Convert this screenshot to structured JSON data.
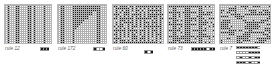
{
  "figure": {
    "type": "cellular-automaton-panels",
    "background": "#ffffff",
    "cell_on_color": "#1a1a1a",
    "cell_off_color": "#ffffff",
    "grid_line_color": "#b0b0b0",
    "caption_color": "#5a5a5a",
    "panel_count": 5
  },
  "panels": [
    {
      "id": "panel-1",
      "caption": "rule 12",
      "rule_number": 12,
      "x": 4,
      "y": 4,
      "width": 48,
      "height": 40,
      "cols": 24,
      "rows": 20,
      "pattern": "vertical-stripes",
      "seed": 12,
      "legend_x": 40,
      "legend_y": 47,
      "legend_cells": 3
    },
    {
      "id": "panel-2",
      "caption": "rule 172",
      "rule_number": 172,
      "x": 57,
      "y": 4,
      "width": 50,
      "height": 40,
      "cols": 25,
      "rows": 20,
      "pattern": "triangle-growth",
      "seed": 172,
      "legend_x": 93,
      "legend_y": 47,
      "legend_cells": 4
    },
    {
      "id": "panel-3",
      "caption": "rule 60",
      "rule_number": 60,
      "x": 112,
      "y": 4,
      "width": 52,
      "height": 40,
      "cols": 26,
      "rows": 20,
      "pattern": "nested-checker",
      "seed": 60,
      "legend_x": 144,
      "legend_y": 50,
      "legend_cells": 3
    },
    {
      "id": "panel-4",
      "caption": "rule 73",
      "rule_number": 73,
      "x": 167,
      "y": 4,
      "width": 48,
      "height": 40,
      "cols": 24,
      "rows": 20,
      "pattern": "vertical-bands-blocky",
      "seed": 73,
      "legend_x": 191,
      "legend_y": 47,
      "legend_cells": 8
    },
    {
      "id": "panel-5",
      "caption": "rule 7",
      "rule_number": 7,
      "x": 219,
      "y": 4,
      "width": 52,
      "height": 40,
      "cols": 26,
      "rows": 20,
      "pattern": "chaotic-segments",
      "seed": 7,
      "legend_x": 236,
      "legend_y": 46,
      "legend_rows": 4,
      "legend_cells": 8
    }
  ],
  "captions": {
    "panel_1": "rule 12",
    "panel_2": "rule 172",
    "panel_3": "rule 60",
    "panel_4": "rule 73",
    "panel_5": "rule 7"
  },
  "chart_data": {
    "type": "heatmap",
    "title": "",
    "xlabel": "",
    "ylabel": "",
    "series": [
      {
        "name": "rule 12",
        "rule": 12,
        "cols": 24,
        "rows": 20,
        "character": "stable vertical stripes"
      },
      {
        "name": "rule 172",
        "rule": 172,
        "cols": 25,
        "rows": 20,
        "character": "diagonal triangular growth with vertical walls"
      },
      {
        "name": "rule 60",
        "rule": 60,
        "cols": 26,
        "rows": 20,
        "character": "dense nested checkerboard"
      },
      {
        "name": "rule 73",
        "rule": 73,
        "cols": 24,
        "rows": 20,
        "character": "vertical bands with blocky inclusions"
      },
      {
        "name": "rule 7",
        "rule": 7,
        "cols": 26,
        "rows": 20,
        "character": "chaotic horizontal segments"
      }
    ],
    "legend": "black = state 1 (alive), white = state 0 (dead)",
    "grid": true
  }
}
